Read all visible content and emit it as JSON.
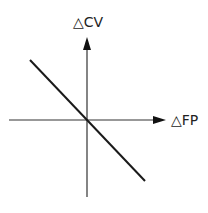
{
  "diagram": {
    "y_axis_label": "△CV",
    "x_axis_label": "△FP",
    "line": {
      "description": "downward-sloping line through origin",
      "slope_sign": "negative"
    },
    "colors": {
      "stroke": "#1a1a1a",
      "axis": "#333333",
      "background": "#ffffff"
    }
  }
}
